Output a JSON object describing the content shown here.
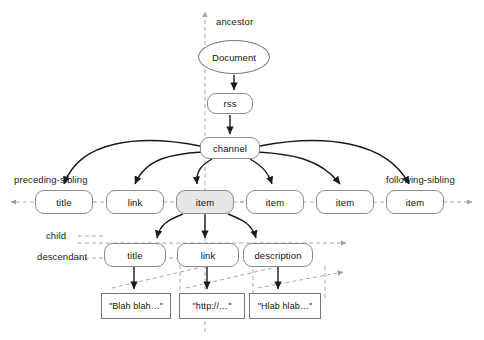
{
  "diagram": {
    "colors": {
      "node_border": "#8a8a8a",
      "node_fill": "#ffffff",
      "context_node_fill": "#e6e6e6",
      "solid_edge": "#1a1a1a",
      "axis_dashed": "#a8a8a8",
      "text": "#111111",
      "background": "#ffffff"
    },
    "axis_labels": [
      {
        "id": "ancestor",
        "text": "ancestor",
        "x": 216,
        "y": 16
      },
      {
        "id": "preceding-sibling",
        "text": "preceding-sibling",
        "x": 14,
        "y": 174
      },
      {
        "id": "following-sibling",
        "text": "following-sibling",
        "x": 386,
        "y": 174
      },
      {
        "id": "child",
        "text": "child",
        "x": 46,
        "y": 237
      },
      {
        "id": "descendant",
        "text": "descendant",
        "x": 37,
        "y": 252
      }
    ],
    "nodes": [
      {
        "id": "document",
        "label": "Document",
        "shape": "ellipse",
        "x": 198,
        "y": 40,
        "w": 72,
        "h": 34,
        "shaded": false
      },
      {
        "id": "rss",
        "label": "rss",
        "shape": "rounded",
        "x": 207,
        "y": 93,
        "w": 46,
        "h": 21,
        "shaded": false
      },
      {
        "id": "channel",
        "label": "channel",
        "shape": "rounded",
        "x": 200,
        "y": 137,
        "w": 60,
        "h": 22,
        "shaded": false
      },
      {
        "id": "title-1",
        "label": "title",
        "shape": "rounded",
        "x": 35,
        "y": 190,
        "w": 58,
        "h": 24,
        "shaded": false
      },
      {
        "id": "link-1",
        "label": "link",
        "shape": "rounded",
        "x": 106,
        "y": 190,
        "w": 58,
        "h": 24,
        "shaded": false
      },
      {
        "id": "item-1",
        "label": "item",
        "shape": "rounded",
        "x": 176,
        "y": 190,
        "w": 58,
        "h": 24,
        "shaded": true
      },
      {
        "id": "item-2",
        "label": "item",
        "shape": "rounded",
        "x": 246,
        "y": 190,
        "w": 58,
        "h": 24,
        "shaded": false
      },
      {
        "id": "item-3",
        "label": "item",
        "shape": "rounded",
        "x": 316,
        "y": 190,
        "w": 58,
        "h": 24,
        "shaded": false
      },
      {
        "id": "item-4",
        "label": "item",
        "shape": "rounded",
        "x": 386,
        "y": 190,
        "w": 58,
        "h": 24,
        "shaded": false
      },
      {
        "id": "title-2",
        "label": "title",
        "shape": "rounded",
        "x": 104,
        "y": 243,
        "w": 62,
        "h": 24,
        "shaded": false
      },
      {
        "id": "link-2",
        "label": "link",
        "shape": "rounded",
        "x": 177,
        "y": 243,
        "w": 62,
        "h": 24,
        "shaded": false
      },
      {
        "id": "description",
        "label": "description",
        "shape": "rounded",
        "x": 243,
        "y": 243,
        "w": 70,
        "h": 24,
        "shaded": false
      },
      {
        "id": "text-1",
        "label": "\"Blah blah…\"",
        "shape": "rect",
        "x": 101,
        "y": 293,
        "w": 70,
        "h": 26,
        "shaded": false
      },
      {
        "id": "text-2",
        "label": "\"http://…\"",
        "shape": "rect",
        "x": 179,
        "y": 293,
        "w": 66,
        "h": 26,
        "shaded": false
      },
      {
        "id": "text-3",
        "label": "\"Hlab hlab…\"",
        "shape": "rect",
        "x": 249,
        "y": 293,
        "w": 72,
        "h": 26,
        "shaded": false
      }
    ],
    "edges": [
      {
        "from": "document",
        "to": "rss",
        "kind": "solid"
      },
      {
        "from": "rss",
        "to": "channel",
        "kind": "solid"
      },
      {
        "from": "channel",
        "to": "title-1",
        "kind": "solid-curve"
      },
      {
        "from": "channel",
        "to": "link-1",
        "kind": "solid-curve"
      },
      {
        "from": "channel",
        "to": "item-1",
        "kind": "solid-curve"
      },
      {
        "from": "channel",
        "to": "item-2",
        "kind": "solid-curve"
      },
      {
        "from": "channel",
        "to": "item-3",
        "kind": "solid-curve"
      },
      {
        "from": "channel",
        "to": "item-4",
        "kind": "solid-curve"
      },
      {
        "from": "item-1",
        "to": "title-2",
        "kind": "solid-curve"
      },
      {
        "from": "item-1",
        "to": "link-2",
        "kind": "solid"
      },
      {
        "from": "item-1",
        "to": "description",
        "kind": "solid-curve"
      },
      {
        "from": "title-2",
        "to": "text-1",
        "kind": "solid"
      },
      {
        "from": "link-2",
        "to": "text-2",
        "kind": "solid"
      },
      {
        "from": "description",
        "to": "text-3",
        "kind": "solid"
      }
    ],
    "axes": [
      {
        "id": "ancestor-axis",
        "direction": "up",
        "orientation": "vertical",
        "x": 205,
        "from_y": 330,
        "to_y": 10
      },
      {
        "id": "preceding-sibling-axis",
        "direction": "left",
        "orientation": "horizontal",
        "y": 202,
        "from_x": 240,
        "to_x": 9
      },
      {
        "id": "following-sibling-axis",
        "direction": "right",
        "orientation": "horizontal",
        "y": 202,
        "from_x": 240,
        "to_x": 474
      },
      {
        "id": "child-axis",
        "direction": "right",
        "orientation": "horizontal",
        "y": 243,
        "from_x": 78,
        "to_x": 348
      },
      {
        "id": "descendant-axis",
        "direction": "right",
        "orientation": "diagonal",
        "from_x": 78,
        "from_y": 258,
        "to_x": 345,
        "to_y": 276
      }
    ]
  }
}
